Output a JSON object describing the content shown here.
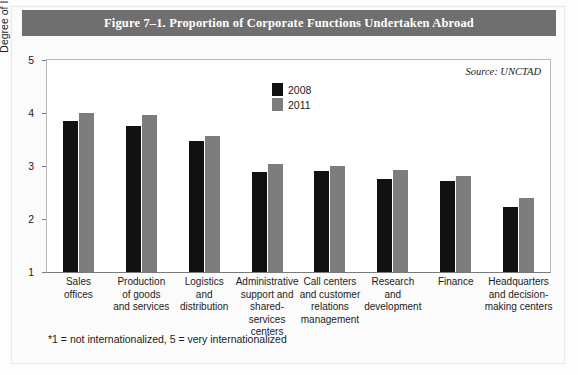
{
  "figure": {
    "title": "Figure 7–1. Proportion of Corporate Functions Undertaken Abroad",
    "source": "Source: UNCTAD",
    "footnote": "*1 = not internationalized, 5 = very internationalized",
    "title_band_color": "#6f6f6f"
  },
  "legend": {
    "items": [
      {
        "label": "2008",
        "color": "#111111"
      },
      {
        "label": "2011",
        "color": "#7d7d7d"
      }
    ]
  },
  "chart_data": {
    "type": "bar",
    "title": "Figure 7–1. Proportion of Corporate Functions Undertaken Abroad",
    "xlabel": "",
    "ylabel": "Degree of Internationalization*",
    "ylim": [
      1,
      5
    ],
    "yticks": [
      1,
      2,
      3,
      4,
      5
    ],
    "ytick_labels": [
      "1",
      "2",
      "3",
      "4",
      "5"
    ],
    "grid": false,
    "legend_position": "top-center",
    "annotations": [
      "Source: UNCTAD",
      "*1 = not internationalized, 5 = very internationalized"
    ],
    "categories": [
      "Sales offices",
      "Production of goods and services",
      "Logistics and distribution",
      "Administrative support and shared-services centers",
      "Call centers and customer relations management",
      "Research and development",
      "Finance",
      "Headquarters and decision-making centers"
    ],
    "category_lines": [
      [
        "Sales",
        "offices"
      ],
      [
        "Production",
        "of goods",
        "and services"
      ],
      [
        "Logistics",
        "and",
        "distribution"
      ],
      [
        "Administrative",
        "support and",
        "shared-services",
        "centers"
      ],
      [
        "Call centers",
        "and customer",
        "relations",
        "management"
      ],
      [
        "Research",
        "and",
        "development"
      ],
      [
        "Finance"
      ],
      [
        "Headquarters",
        "and decision-",
        "making centers"
      ]
    ],
    "series": [
      {
        "name": "2008",
        "color": "#111111",
        "values": [
          3.85,
          3.75,
          3.48,
          2.88,
          2.9,
          2.75,
          2.72,
          2.23
        ]
      },
      {
        "name": "2011",
        "color": "#7d7d7d",
        "values": [
          4.0,
          3.97,
          3.57,
          3.03,
          3.0,
          2.92,
          2.82,
          2.4
        ]
      }
    ]
  }
}
